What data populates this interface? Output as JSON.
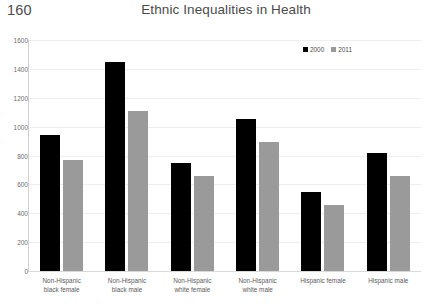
{
  "page": {
    "number": "160",
    "title": "Ethnic Inequalities in Health"
  },
  "colors": {
    "series_2000": "#000000",
    "series_2011": "#9a9a9a",
    "gridline": "#eeeeee",
    "axis": "#d0d0d0",
    "text": "#5c5c5c"
  },
  "legend": {
    "position": "top-right",
    "items": [
      {
        "label": "2000",
        "color": "#000000",
        "icon": "legend-square-black"
      },
      {
        "label": "2011",
        "color": "#9a9a9a",
        "icon": "legend-square-gray"
      }
    ]
  },
  "yaxis": {
    "ticks": [
      "1600",
      "1400",
      "1200",
      "1000",
      "800",
      "600",
      "400",
      "200",
      "0"
    ]
  },
  "chart_data": {
    "type": "bar",
    "title": "Ethnic Inequalities in Health",
    "xlabel": "",
    "ylabel": "",
    "ylim": [
      0,
      1600
    ],
    "ytick_step": 200,
    "grid": true,
    "legend_position": "top-right",
    "categories": [
      "Non-Hispanic black female",
      "Non-Hispanic black male",
      "Non-Hispanic white female",
      "Non-Hispanic white male",
      "Hispanic female",
      "Hispanic male"
    ],
    "category_lines": [
      [
        "Non-Hispanic",
        "black female"
      ],
      [
        "Non-Hispanic",
        "black male"
      ],
      [
        "Non-Hispanic",
        "white female"
      ],
      [
        "Non-Hispanic",
        "white male"
      ],
      [
        "Hispanic female"
      ],
      [
        "Hispanic male"
      ]
    ],
    "series": [
      {
        "name": "2000",
        "color": "#000000",
        "values": [
          940,
          1450,
          745,
          1055,
          550,
          820
        ]
      },
      {
        "name": "2011",
        "color": "#9a9a9a",
        "values": [
          770,
          1105,
          655,
          895,
          460,
          655
        ]
      }
    ]
  }
}
